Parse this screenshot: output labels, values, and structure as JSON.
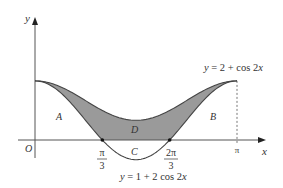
{
  "figure": {
    "type": "function-graph-diagram",
    "axes": {
      "x_label": "x",
      "y_label": "y",
      "origin_label": "O",
      "x_ticks": [
        {
          "num": "π",
          "den": "3",
          "value": 1.0471975512
        },
        {
          "num": "2π",
          "den": "3",
          "value": 2.0943951024
        },
        {
          "num": "π",
          "den": "",
          "value": 3.1415926536
        }
      ]
    },
    "curves": [
      {
        "id": "upper",
        "equation": "y = 2 + cos 2x",
        "label": "y = 2 + cos 2x"
      },
      {
        "id": "lower",
        "equation": "y = 1 + 2 cos 2x",
        "label": "y = 1 + 2 cos 2x"
      }
    ],
    "regions": [
      {
        "id": "A",
        "label": "A",
        "description": "between y-axis, x-axis and lower curve on [0, π/3]"
      },
      {
        "id": "B",
        "label": "B",
        "description": "between x-axis, line x=π and lower curve on [2π/3, π]"
      },
      {
        "id": "C",
        "label": "C",
        "description": "between x-axis and lower curve on [π/3, 2π/3]"
      },
      {
        "id": "D",
        "label": "D",
        "description": "shaded region between upper curve, lower curve and x-axis"
      }
    ],
    "shading_color": "#9a9a9a",
    "curve_color": "#444444",
    "axis_color": "#555555",
    "dotted_line": {
      "x": "π"
    }
  }
}
